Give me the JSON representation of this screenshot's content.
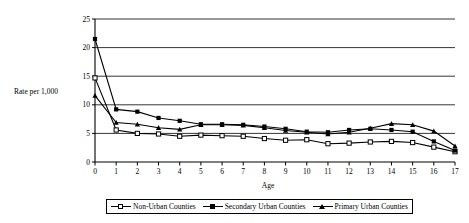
{
  "chart_data": {
    "type": "line",
    "title": "",
    "xlabel": "Age",
    "ylabel": "Rate per 1,000",
    "x": [
      0,
      1,
      2,
      3,
      4,
      5,
      6,
      7,
      8,
      9,
      10,
      11,
      12,
      13,
      14,
      15,
      16,
      17
    ],
    "xticklabels": [
      "0",
      "1",
      "2",
      "3",
      "4",
      "5",
      "6",
      "7",
      "8",
      "9",
      "10",
      "11",
      "12",
      "13",
      "14",
      "15",
      "16",
      "17"
    ],
    "xlim": [
      0,
      17
    ],
    "ylim": [
      0,
      25
    ],
    "yticks": [
      0,
      5,
      10,
      15,
      20,
      25
    ],
    "yticklabels": [
      "0",
      "5",
      "10",
      "15",
      "20",
      "25"
    ],
    "grid": "horizontal",
    "legend_position": "bottom",
    "series": [
      {
        "name": "Non-Urban Counties",
        "marker": "open-square",
        "values": [
          14.7,
          5.6,
          5.0,
          4.9,
          4.5,
          4.7,
          4.6,
          4.5,
          4.1,
          3.8,
          3.9,
          3.2,
          3.3,
          3.5,
          3.6,
          3.4,
          2.6,
          1.8
        ]
      },
      {
        "name": "Secondary Urban Counties",
        "marker": "filled-square",
        "values": [
          21.5,
          9.2,
          8.8,
          7.7,
          7.2,
          6.6,
          6.6,
          6.5,
          6.2,
          5.8,
          5.3,
          5.2,
          5.6,
          5.8,
          5.6,
          5.3,
          3.6,
          2.0
        ]
      },
      {
        "name": "Primary Urban Counties",
        "marker": "filled-triangle",
        "values": [
          11.6,
          6.9,
          6.6,
          6.0,
          5.7,
          6.5,
          6.5,
          6.4,
          6.0,
          5.5,
          5.2,
          4.9,
          5.2,
          5.9,
          6.7,
          6.5,
          5.4,
          2.8
        ]
      }
    ]
  },
  "legend": {
    "items": [
      {
        "label": "Non-Urban Counties"
      },
      {
        "label": "Secondary Urban Counties"
      },
      {
        "label": "Primary Urban Counties"
      }
    ]
  }
}
